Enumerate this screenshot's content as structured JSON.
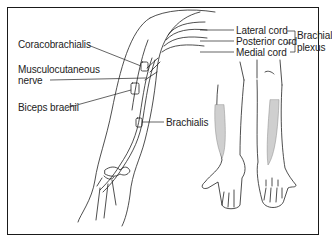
{
  "figure": {
    "labels": {
      "coracobrachialis": "Coracobrachialis",
      "musculocutaneous_line1": "Musculocutaneous",
      "musculocutaneous_line2": "nerve",
      "biceps_brachii": "Biceps brachii",
      "brachialis": "Brachialis",
      "lateral_cord": "Lateral cord",
      "posterior_cord": "Posterior cord",
      "medial_cord": "Medial cord",
      "brachial_plexus_line1": "Brachial",
      "brachial_plexus_line2": "plexus"
    },
    "colors": {
      "line": "#222222",
      "sensory_shading": "#cfcfcf",
      "border": "#1a1a1a"
    }
  }
}
